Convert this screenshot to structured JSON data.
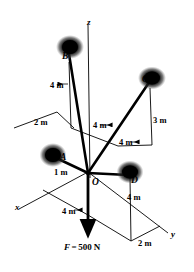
{
  "figure": {
    "type": "statics-free-body-diagram",
    "stroke_color": "#000000",
    "background_color": "#ffffff"
  },
  "axes": [
    {
      "name": "z-axis",
      "label": "z",
      "x": 87,
      "y": 18
    },
    {
      "name": "x-axis",
      "label": "x",
      "x": 15,
      "y": 203
    },
    {
      "name": "y-axis",
      "label": "y",
      "x": 171,
      "y": 230
    }
  ],
  "nodes": [
    {
      "name": "node-B",
      "label": "B",
      "x": 62,
      "y": 52
    },
    {
      "name": "node-C",
      "label": "C",
      "x": 142,
      "y": 75
    },
    {
      "name": "node-A",
      "label": "A",
      "x": 60,
      "y": 153
    },
    {
      "name": "node-D",
      "label": "D",
      "x": 131,
      "y": 176
    },
    {
      "name": "node-O",
      "label": "O",
      "x": 92,
      "y": 178
    }
  ],
  "dimensions": [
    {
      "name": "dim-b-height",
      "label": "4 m",
      "x": 50,
      "y": 81
    },
    {
      "name": "dim-b-offset",
      "label": "2 m",
      "x": 34,
      "y": 118
    },
    {
      "name": "dim-b-reach",
      "label": "4 m",
      "x": 93,
      "y": 121
    },
    {
      "name": "dim-c-height",
      "label": "3 m",
      "x": 153,
      "y": 116
    },
    {
      "name": "dim-c-reach",
      "label": "4 m",
      "x": 119,
      "y": 138
    },
    {
      "name": "dim-a-offset",
      "label": "1 m",
      "x": 54,
      "y": 168
    },
    {
      "name": "dim-d-height",
      "label": "4 m",
      "x": 127,
      "y": 193
    },
    {
      "name": "dim-x-reach",
      "label": "4 m",
      "x": 62,
      "y": 207
    },
    {
      "name": "dim-y-offset",
      "label": "2 m",
      "x": 138,
      "y": 239
    }
  ],
  "force": {
    "name": "applied-force",
    "symbol": "F",
    "equals": "=",
    "magnitude": "500",
    "unit": "N",
    "full_label": "F = 500 N",
    "x": 64,
    "y": 243
  }
}
